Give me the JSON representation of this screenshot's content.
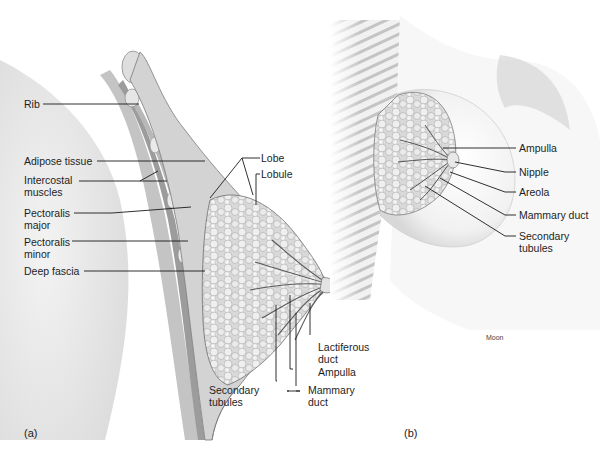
{
  "figure": {
    "panels": [
      {
        "id": "a",
        "panel_label": "(a)",
        "view": "sagittal section",
        "labels": {
          "rib": "Rib",
          "adipose_tissue": "Adipose tissue",
          "intercostal_muscles": "Intercostal muscles",
          "pectoralis_major": "Pectoralis major",
          "pectoralis_minor": "Pectoralis minor",
          "deep_fascia": "Deep fascia",
          "lobe": "Lobe",
          "lobule": "Lobule",
          "lactiferous_duct": "Lactiferous duct",
          "ampulla": "Ampulla",
          "mammary_duct": "Mammary duct",
          "secondary_tubules": "Secondary tubules"
        }
      },
      {
        "id": "b",
        "panel_label": "(b)",
        "view": "anterior cutaway",
        "labels": {
          "ampulla": "Ampulla",
          "nipple": "Nipple",
          "areola": "Areola",
          "mammary_duct": "Mammary duct",
          "secondary_tubules": "Secondary tubules"
        }
      }
    ],
    "artist_credit": "Moon",
    "colors": {
      "line": "#1a1a1a",
      "tissue_light": "#e8e8e8",
      "tissue_mid": "#c9c9c9",
      "tissue_dark": "#8f8f8f",
      "muscle": "#a8a8a8",
      "background": "#ffffff"
    }
  }
}
